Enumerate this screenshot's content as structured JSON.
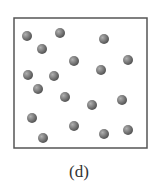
{
  "diagram": {
    "caption": "(d)",
    "box": {
      "x": 14,
      "y": 18,
      "width": 133,
      "height": 130,
      "stroke": "#555555"
    },
    "particle_color": "#7a7a7a",
    "particle_radius": 5,
    "particles": [
      [
        27,
        36
      ],
      [
        60,
        33
      ],
      [
        42,
        49
      ],
      [
        104,
        39
      ],
      [
        74,
        61
      ],
      [
        128,
        60
      ],
      [
        101,
        70
      ],
      [
        28,
        75
      ],
      [
        54,
        76
      ],
      [
        38,
        89
      ],
      [
        65,
        97
      ],
      [
        92,
        105
      ],
      [
        122,
        100
      ],
      [
        32,
        118
      ],
      [
        74,
        126
      ],
      [
        104,
        134
      ],
      [
        128,
        130
      ],
      [
        43,
        138
      ]
    ]
  }
}
